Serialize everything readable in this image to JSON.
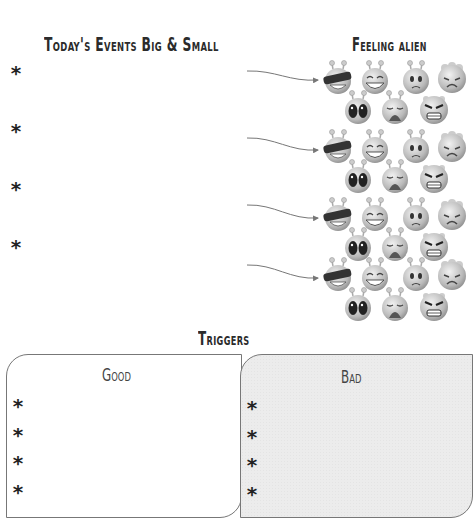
{
  "header": {
    "events_title": "Today's Events Big & Small",
    "feeling_title": "Feeling alien"
  },
  "events": {
    "bullet": "*",
    "items": [
      "",
      "",
      "",
      ""
    ]
  },
  "emotion_faces": [
    "cool-sunglasses",
    "laughing",
    "worried",
    "sad",
    "shocked",
    "crying",
    "angry"
  ],
  "triggers": {
    "title": "Triggers",
    "good": {
      "title": "Good",
      "bullet": "*",
      "items": [
        "",
        "",
        "",
        ""
      ]
    },
    "bad": {
      "title": "Bad",
      "bullet": "*",
      "items": [
        "",
        "",
        "",
        ""
      ]
    }
  },
  "colors": {
    "ink": "#2b2b2b",
    "bad_fill": "#ececec",
    "border": "#777777"
  }
}
